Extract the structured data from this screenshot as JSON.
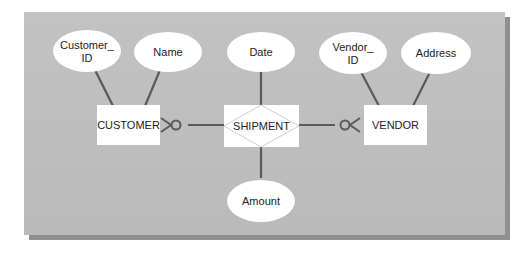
{
  "diagram": {
    "type": "entity-relationship",
    "entities": [
      {
        "id": "customer",
        "label": "CUSTOMER"
      },
      {
        "id": "vendor",
        "label": "VENDOR"
      }
    ],
    "relationship": {
      "id": "shipment",
      "label": "SHIPMENT",
      "shape": "associative-entity"
    },
    "attributes": [
      {
        "owner": "customer",
        "label_line1": "Customer_",
        "label_line2": "ID"
      },
      {
        "owner": "customer",
        "label": "Name"
      },
      {
        "owner": "shipment",
        "label": "Date"
      },
      {
        "owner": "shipment",
        "label": "Amount"
      },
      {
        "owner": "vendor",
        "label_line1": "Vendor_",
        "label_line2": "ID"
      },
      {
        "owner": "vendor",
        "label": "Address"
      }
    ],
    "connections": [
      {
        "from": "customer",
        "to": "shipment",
        "cardinality_at_customer": "zero-or-many"
      },
      {
        "from": "shipment",
        "to": "vendor",
        "cardinality_at_vendor": "zero-or-many"
      }
    ]
  },
  "colors": {
    "background": "#bdbdbd",
    "shape_fill": "#ffffff",
    "line": "#555555",
    "text": "#222222"
  }
}
